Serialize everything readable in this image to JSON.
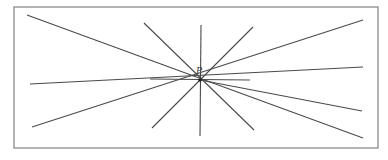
{
  "diagram": {
    "title": "",
    "center": {
      "x": 200,
      "y": 80,
      "label": "P"
    },
    "frame": {
      "x": 14,
      "y": 7,
      "width": 364,
      "height": 141
    },
    "lines": [
      {
        "id": "line-1",
        "x1": 27,
        "y1": 15,
        "x2": 363,
        "y2": 138
      },
      {
        "id": "line-2",
        "x1": 32,
        "y1": 127,
        "x2": 363,
        "y2": 20
      },
      {
        "id": "line-3",
        "x1": 30,
        "y1": 84,
        "x2": 363,
        "y2": 67
      },
      {
        "id": "line-4",
        "x1": 144,
        "y1": 23,
        "x2": 254,
        "y2": 130
      },
      {
        "id": "line-5",
        "x1": 253,
        "y1": 27,
        "x2": 152,
        "y2": 128
      },
      {
        "id": "line-6",
        "x1": 201,
        "y1": 25,
        "x2": 200,
        "y2": 136
      },
      {
        "id": "line-7",
        "x1": 150,
        "y1": 79,
        "x2": 250,
        "y2": 80
      },
      {
        "id": "line-8",
        "x1": 200,
        "y1": 80,
        "x2": 362,
        "y2": 111
      }
    ],
    "colors": {
      "line": "#4a4a4a",
      "frame": "#8a8a8a",
      "background": "#ffffff"
    }
  }
}
